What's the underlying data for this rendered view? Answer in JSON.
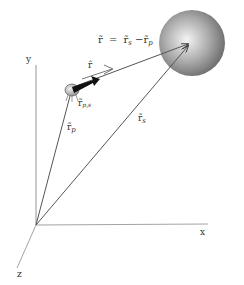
{
  "diagram": {
    "axes": {
      "x_label": "x",
      "y_label": "y",
      "z_label": "z"
    },
    "equation": {
      "text": "r̃ = r̃s − r̃p",
      "lhs": "r̃",
      "eq": "=",
      "rhs_a": "r̃",
      "rhs_a_sub": "s",
      "minus": "−",
      "rhs_b": "r̃",
      "rhs_b_sub": "p"
    },
    "labels": {
      "r_hat": "r̂",
      "r_p": "r̃",
      "r_p_sub": "p",
      "r_s": "r̃",
      "r_s_sub": "s",
      "r_ps": "r̃",
      "r_ps_sub": "p,s"
    },
    "colors": {
      "line": "#555555",
      "sphere_light": "#f2f2f2",
      "sphere_dark": "#6a6a6a",
      "arrow_bold": "#111111"
    }
  }
}
